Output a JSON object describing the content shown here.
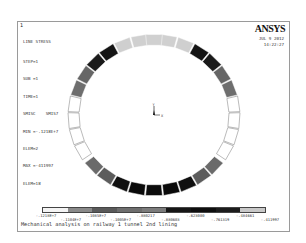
{
  "window": {
    "number": "1",
    "logo": "ANSYS",
    "date": "JUL  9 2012",
    "time": "14:22:27"
  },
  "info": {
    "title": "LINE STRESS",
    "lines": [
      "STEP=1",
      "SUB =1",
      "TIME=1",
      "SMISC    SMIS7",
      "MIN =-.1218E+7",
      "ELEM=2",
      "MAX =-411997",
      "ELEM=18"
    ]
  },
  "triad": {
    "y_label": "Y",
    "x_label": "X"
  },
  "legend": {
    "colors": [
      "#f4f4f4",
      "#8a8a8a",
      "#5a5a5a",
      "#6e6e6e",
      "#7c7c7c",
      "#161616",
      "#0e0e0e",
      "#1c1c1c",
      "#c8c8c8"
    ],
    "labels_top": [
      "-.1218E+7",
      "-.1085E+7",
      "-.880217",
      "-.623000",
      "-.484661"
    ],
    "labels_bottom": [
      "-.1104E+7",
      "-.1005E+7",
      "-.880603",
      "-.761319",
      "-.411997"
    ]
  },
  "caption": "Mechanical analysis on railway 1 tunnel 2nd lining",
  "ring": {
    "center_x": 136,
    "center_y": 93,
    "radius_x": 75,
    "radius_y": 70,
    "thickness": 11,
    "segments": [
      {
        "angle": 100,
        "color": "#d0d0d0"
      },
      {
        "angle": 80,
        "color": "#d0d0d0"
      },
      {
        "angle": 90,
        "color": "#d0d0d0"
      },
      {
        "angle": 112,
        "color": "#cfcfcf"
      },
      {
        "angle": 68,
        "color": "#cfcfcf"
      },
      {
        "angle": 124,
        "color": "#141414"
      },
      {
        "angle": 56,
        "color": "#141414"
      },
      {
        "angle": 136,
        "color": "#1a1a1a"
      },
      {
        "angle": 44,
        "color": "#1a1a1a"
      },
      {
        "angle": 148,
        "color": "#666666"
      },
      {
        "angle": 32,
        "color": "#666666"
      },
      {
        "angle": 160,
        "color": "#6e6e6e"
      },
      {
        "angle": 20,
        "color": "#6e6e6e"
      },
      {
        "angle": 172,
        "color": "#ffffff"
      },
      {
        "angle": 8,
        "color": "#ffffff"
      },
      {
        "angle": 184,
        "color": "#ffffff"
      },
      {
        "angle": -4,
        "color": "#ffffff"
      },
      {
        "angle": 196,
        "color": "#ffffff"
      },
      {
        "angle": -16,
        "color": "#ffffff"
      },
      {
        "angle": 208,
        "color": "#ffffff"
      },
      {
        "angle": -28,
        "color": "#ffffff"
      },
      {
        "angle": 222,
        "color": "#6a6a6a"
      },
      {
        "angle": -42,
        "color": "#6a6a6a"
      },
      {
        "angle": 234,
        "color": "#5c5c5c"
      },
      {
        "angle": -54,
        "color": "#5c5c5c"
      },
      {
        "angle": 246,
        "color": "#101010"
      },
      {
        "angle": -66,
        "color": "#101010"
      },
      {
        "angle": 258,
        "color": "#0a0a0a"
      },
      {
        "angle": -78,
        "color": "#0a0a0a"
      },
      {
        "angle": 270,
        "color": "#0c0c0c"
      }
    ]
  }
}
